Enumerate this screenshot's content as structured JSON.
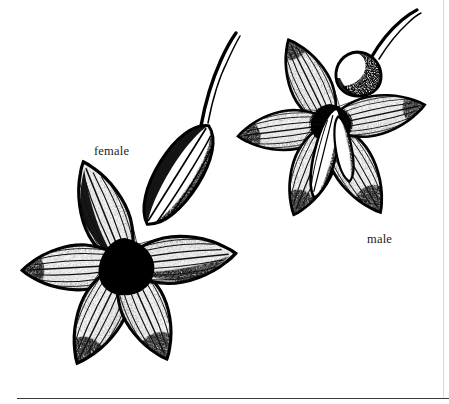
{
  "plate": {
    "title": "Botanical line illustration of female and male flowers",
    "medium": "pen-and-ink stipple drawing",
    "background_color": "#ffffff",
    "ink_color": "#000000",
    "width": 449,
    "height": 404
  },
  "labels": {
    "female": "female",
    "male": "male"
  },
  "figures": [
    {
      "id": "female-flower",
      "label": "female",
      "position": "lower-left",
      "center": [
        125,
        265
      ],
      "petal_count": 5,
      "parts": [
        "petals",
        "dark center",
        "ribbed inferior ovary",
        "curved style"
      ]
    },
    {
      "id": "male-flower",
      "label": "male",
      "position": "upper-right",
      "center": [
        330,
        125
      ],
      "petal_count": 5,
      "parts": [
        "petals",
        "stamen column",
        "bulbous pedicel",
        "curved stalk"
      ]
    }
  ],
  "rules": {
    "bottom_rule": "horizontal rule",
    "right_rule": "vertical margin rule"
  }
}
